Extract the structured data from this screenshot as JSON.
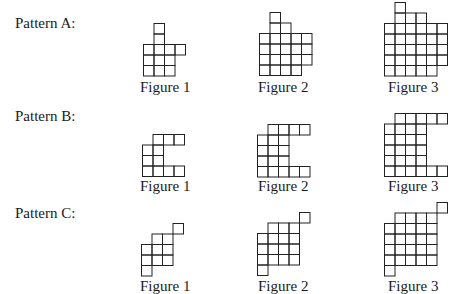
{
  "cell_size": 10.5,
  "line_color": "#222222",
  "patterns": [
    {
      "label": "Pattern A:",
      "label_top": 15,
      "grid_bottom": 75,
      "figure_label_top": 79,
      "figures": [
        {
          "label": "Figure 1",
          "left": 143,
          "label_left": 140,
          "rows": [
            [
              2
            ],
            [
              2
            ],
            [
              1,
              2,
              3,
              4
            ],
            [
              1,
              2,
              3
            ],
            [
              1,
              2,
              3
            ]
          ]
        },
        {
          "label": "Figure 2",
          "left": 259,
          "label_left": 258,
          "rows": [
            [
              2
            ],
            [
              2,
              3
            ],
            [
              1,
              2,
              3,
              4,
              5
            ],
            [
              1,
              2,
              3,
              4,
              5
            ],
            [
              1,
              2,
              3,
              4,
              5
            ],
            [
              1,
              2,
              3,
              4
            ]
          ]
        },
        {
          "label": "Figure 3",
          "left": 384,
          "label_left": 388,
          "rows": [
            [
              2
            ],
            [
              2,
              3,
              4
            ],
            [
              1,
              2,
              3,
              4,
              5,
              6
            ],
            [
              1,
              2,
              3,
              4,
              5,
              6
            ],
            [
              1,
              2,
              3,
              4,
              5,
              6
            ],
            [
              1,
              2,
              3,
              4,
              5,
              6
            ],
            [
              1,
              2,
              3,
              4,
              5
            ]
          ]
        }
      ]
    },
    {
      "label": "Pattern B:",
      "label_top": 108,
      "grid_bottom": 176,
      "figure_label_top": 178,
      "figures": [
        {
          "label": "Figure 1",
          "left": 142,
          "label_left": 140,
          "rows": [
            [
              2,
              3,
              4
            ],
            [
              1,
              2
            ],
            [
              1,
              2
            ],
            [
              1,
              2,
              3,
              4
            ]
          ]
        },
        {
          "label": "Figure 2",
          "left": 257,
          "label_left": 258,
          "rows": [
            [
              2,
              3,
              4,
              5
            ],
            [
              1,
              2,
              3
            ],
            [
              1,
              2,
              3
            ],
            [
              1,
              2,
              3
            ],
            [
              1,
              2,
              3,
              4,
              5
            ]
          ]
        },
        {
          "label": "Figure 3",
          "left": 384,
          "label_left": 388,
          "rows": [
            [
              2,
              3,
              4,
              5,
              6
            ],
            [
              1,
              2,
              3,
              4
            ],
            [
              1,
              2,
              3,
              4
            ],
            [
              1,
              2,
              3,
              4
            ],
            [
              1,
              2,
              3,
              4
            ],
            [
              1,
              2,
              3,
              4,
              5,
              6
            ]
          ]
        }
      ]
    },
    {
      "label": "Pattern C:",
      "label_top": 205,
      "grid_bottom": 275,
      "figure_label_top": 278,
      "figures": [
        {
          "label": "Figure 1",
          "left": 141,
          "label_left": 140,
          "rows": [
            [
              4
            ],
            [
              2,
              3
            ],
            [
              1,
              2,
              3
            ],
            [
              1,
              2,
              3
            ],
            [
              1
            ]
          ]
        },
        {
          "label": "Figure 2",
          "left": 257,
          "label_left": 258,
          "rows": [
            [
              5
            ],
            [
              2,
              3,
              4
            ],
            [
              1,
              2,
              3,
              4
            ],
            [
              1,
              2,
              3,
              4
            ],
            [
              1,
              2,
              3,
              4
            ],
            [
              1
            ]
          ]
        },
        {
          "label": "Figure 3",
          "left": 384,
          "label_left": 388,
          "rows": [
            [
              6
            ],
            [
              2,
              3,
              4,
              5
            ],
            [
              1,
              2,
              3,
              4,
              5
            ],
            [
              1,
              2,
              3,
              4,
              5
            ],
            [
              1,
              2,
              3,
              4,
              5
            ],
            [
              1,
              2,
              3,
              4,
              5
            ],
            [
              1
            ]
          ]
        }
      ]
    }
  ]
}
